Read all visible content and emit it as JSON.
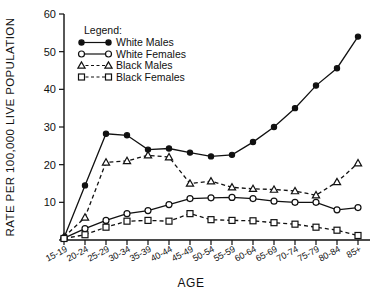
{
  "chart_data": {
    "type": "line",
    "title": "",
    "xlabel": "AGE",
    "ylabel": "RATE PER 100,000 LIVE POPULATION",
    "ylim": [
      0,
      60
    ],
    "yticks": [
      0,
      10,
      20,
      30,
      40,
      50,
      60
    ],
    "ytick_labels": [
      "",
      "10",
      "20",
      "30",
      "40",
      "50",
      "60"
    ],
    "grid": false,
    "legend_position": "upper-left",
    "legend_title": "Legend:",
    "categories": [
      "15-19",
      "20-24",
      "25-29",
      "30-34",
      "35-39",
      "40-44",
      "45-49",
      "50-54",
      "55-59",
      "60-64",
      "65-69",
      "70-74",
      "75-79",
      "80-84",
      "85+"
    ],
    "series": [
      {
        "name": "White Males",
        "marker": "filled-circle",
        "line": "solid",
        "values": [
          0.6,
          14.5,
          28.2,
          27.8,
          24.0,
          24.3,
          23.2,
          22.2,
          22.6,
          26.0,
          30.0,
          35.0,
          41.0,
          45.6,
          54.0
        ]
      },
      {
        "name": "White Females",
        "marker": "open-circle",
        "line": "solid",
        "values": [
          0.5,
          3.0,
          5.2,
          7.0,
          7.8,
          9.4,
          11.0,
          11.2,
          11.3,
          11.0,
          10.3,
          10.0,
          10.0,
          8.0,
          8.6
        ]
      },
      {
        "name": "Black Males",
        "marker": "open-triangle",
        "line": "dashed",
        "values": [
          0.8,
          6.0,
          20.6,
          21.0,
          22.5,
          22.0,
          15.0,
          15.6,
          14.0,
          13.6,
          13.4,
          13.0,
          11.9,
          15.4,
          20.4
        ]
      },
      {
        "name": "Black Females",
        "marker": "open-square",
        "line": "dashed",
        "values": [
          0.4,
          1.4,
          3.4,
          5.0,
          5.2,
          5.0,
          7.0,
          5.4,
          5.2,
          5.1,
          4.6,
          4.2,
          3.4,
          2.6,
          1.2
        ]
      }
    ]
  }
}
